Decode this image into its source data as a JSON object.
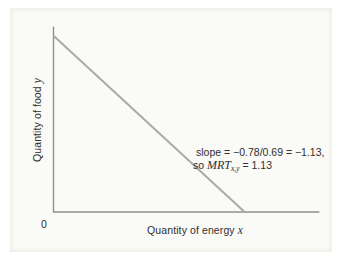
{
  "figure": {
    "origin_label": "0",
    "y_axis": {
      "label": "Quantity of food ",
      "var": "y"
    },
    "x_axis": {
      "label": "Quantity of energy ",
      "var": "x"
    },
    "annotation": {
      "line1": "slope = −0.78/0.69 = −1.13,",
      "line2_prefix": "so ",
      "line2_var": "MRT",
      "line2_sub": "x,y",
      "line2_suffix": " = 1.13"
    }
  },
  "colors": {
    "axis": "#8f8f8d",
    "line": "#aaaaa8",
    "text": "#2f2f2f",
    "panel_bg": "#fafaf7"
  },
  "chart_data": {
    "type": "line",
    "title": "",
    "xlabel": "Quantity of energy x",
    "ylabel": "Quantity of food y",
    "series": [
      {
        "name": "transformation-line",
        "points": [
          {
            "x": 0,
            "y": 0.78
          },
          {
            "x": 0.69,
            "y": 0
          }
        ]
      }
    ],
    "slope": -1.13,
    "slope_expression": "-0.78/0.69",
    "mrt_xy": 1.13,
    "annotation_text": "slope = −0.78/0.69 = −1.13, so MRT x,y = 1.13",
    "axes": {
      "x_min": 0,
      "x_max": 0.96,
      "y_min": 0,
      "y_max": 0.82,
      "ticks_shown": [
        "0"
      ]
    },
    "grid": false,
    "legend": false
  }
}
